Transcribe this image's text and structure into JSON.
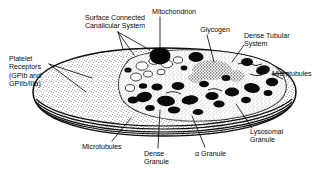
{
  "figure": {
    "kind": "scientific-line-diagram",
    "style": "black and white stippled cut-away drawing",
    "ink": "#0d0d0d",
    "paper": "#ffffff"
  },
  "labels": [
    {
      "id": "surface-connected-canalicular-system",
      "text": "Surface Connected\nCanalicular System",
      "x": 72,
      "y": 14,
      "align": "center",
      "width": 86
    },
    {
      "id": "mitochondrion",
      "text": "Mitochondrion",
      "x": 143,
      "y": 8,
      "align": "center",
      "width": 62
    },
    {
      "id": "glycogen",
      "text": "Glycogen",
      "x": 193,
      "y": 26,
      "align": "center",
      "width": 44
    },
    {
      "id": "dense-tubular-system",
      "text": "Dense Tubular\nSystem",
      "x": 244,
      "y": 32,
      "align": "left",
      "width": 62
    },
    {
      "id": "platelet-receptors",
      "text": "Platelet\nReceptors\n(GPIb and\nGPIIb/IIIa)",
      "x": 9,
      "y": 55,
      "align": "left",
      "width": 52
    },
    {
      "id": "microtubules-right",
      "text": "Microtubules",
      "x": 272,
      "y": 70,
      "align": "left",
      "width": 56
    },
    {
      "id": "lysosomal-granule",
      "text": "Lysosomal\nGranule",
      "x": 250,
      "y": 128,
      "align": "left",
      "width": 52
    },
    {
      "id": "microtubules-bottom",
      "text": "Microtubules",
      "x": 82,
      "y": 143,
      "align": "left",
      "width": 56
    },
    {
      "id": "dense-granule",
      "text": "Dense\nGranule",
      "x": 144,
      "y": 150,
      "align": "left",
      "width": 36
    },
    {
      "id": "alpha-granule",
      "text": "α Granule",
      "x": 195,
      "y": 150,
      "align": "left",
      "width": 44
    }
  ],
  "structures": [
    {
      "id": "plasma-membrane",
      "description": "discoid outer boundary of the platelet"
    },
    {
      "id": "cut-away-face",
      "description": "elliptical cut face revealing cytoplasm"
    },
    {
      "id": "cytoplasm-stipple",
      "description": "fine dotted cytoplasmic matrix"
    },
    {
      "id": "alpha-granules",
      "description": "numerous solid dark oval granules"
    },
    {
      "id": "mitochondrion-body",
      "description": "solid black oval organelle"
    },
    {
      "id": "glycogen-cluster",
      "description": "dense speckled rosette patch"
    },
    {
      "id": "canalicular-openings",
      "description": "pale vacuolar channels opening to surface"
    },
    {
      "id": "microtubule-band",
      "description": "parallel marginal bands at the equator"
    }
  ]
}
